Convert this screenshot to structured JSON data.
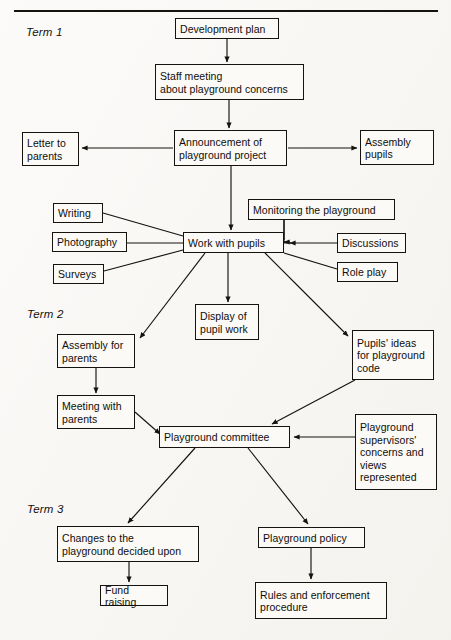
{
  "page": {
    "header_partial_text": "",
    "background_color": "#f5f3ef",
    "ink_color": "#16120e"
  },
  "terms": [
    {
      "id": "term-1",
      "label": "Term 1",
      "x": 26,
      "y": 26
    },
    {
      "id": "term-2",
      "label": "Term 2",
      "x": 27,
      "y": 308
    },
    {
      "id": "term-3",
      "label": "Term 3",
      "x": 27,
      "y": 503
    }
  ],
  "chart_data": {
    "type": "diagram",
    "nodes": [
      {
        "id": "development-plan",
        "label": "Development plan",
        "lines": [
          "Development plan"
        ],
        "x": 175,
        "y": 18,
        "w": 104,
        "h": 21,
        "term": "Term 1"
      },
      {
        "id": "staff-meeting",
        "label": "Staff meeting about playground concerns",
        "lines": [
          "Staff meeting",
          "about playground concerns"
        ],
        "x": 155,
        "y": 64,
        "w": 149,
        "h": 36,
        "term": "Term 1"
      },
      {
        "id": "letter-to-parents",
        "label": "Letter to parents",
        "lines": [
          "Letter to",
          "parents"
        ],
        "x": 22,
        "y": 132,
        "w": 57,
        "h": 34,
        "term": "Term 1"
      },
      {
        "id": "announcement",
        "label": "Announcement of playground project",
        "lines": [
          "Announcement of",
          "playground project"
        ],
        "x": 174,
        "y": 130,
        "w": 113,
        "h": 36,
        "term": "Term 1"
      },
      {
        "id": "assembly-pupils",
        "label": "Assembly pupils",
        "lines": [
          "Assembly",
          "pupils"
        ],
        "x": 360,
        "y": 130,
        "w": 74,
        "h": 35,
        "term": "Term 1"
      },
      {
        "id": "writing",
        "label": "Writing",
        "lines": [
          "Writing"
        ],
        "x": 53,
        "y": 203,
        "w": 50,
        "h": 20,
        "term": "Term 1"
      },
      {
        "id": "photography",
        "label": "Photography",
        "lines": [
          "Photography"
        ],
        "x": 52,
        "y": 232,
        "w": 75,
        "h": 20,
        "term": "Term 1"
      },
      {
        "id": "surveys",
        "label": "Surveys",
        "lines": [
          "Surveys"
        ],
        "x": 53,
        "y": 264,
        "w": 51,
        "h": 20,
        "term": "Term 1"
      },
      {
        "id": "monitoring-playground",
        "label": "Monitoring the playground",
        "lines": [
          "Monitoring the playground"
        ],
        "x": 248,
        "y": 199,
        "w": 147,
        "h": 21,
        "term": "Term 1"
      },
      {
        "id": "work-with-pupils",
        "label": "Work with pupils",
        "lines": [
          "Work with pupils"
        ],
        "x": 183,
        "y": 232,
        "w": 101,
        "h": 21,
        "term": "Term 1"
      },
      {
        "id": "discussions",
        "label": "Discussions",
        "lines": [
          "Discussions"
        ],
        "x": 337,
        "y": 233,
        "w": 69,
        "h": 20,
        "term": "Term 1"
      },
      {
        "id": "role-play",
        "label": "Role play",
        "lines": [
          "Role play"
        ],
        "x": 337,
        "y": 262,
        "w": 61,
        "h": 20,
        "term": "Term 1"
      },
      {
        "id": "display-pupil-work",
        "label": "Display of pupil work",
        "lines": [
          "Display of",
          "pupil work"
        ],
        "x": 195,
        "y": 304,
        "w": 64,
        "h": 36,
        "term": "Term 2"
      },
      {
        "id": "assembly-for-parents",
        "label": "Assembly for parents",
        "lines": [
          "Assembly for",
          "parents"
        ],
        "x": 57,
        "y": 334,
        "w": 78,
        "h": 34,
        "term": "Term 2"
      },
      {
        "id": "pupils-ideas",
        "label": "Pupils' ideas for playground code",
        "lines": [
          "Pupils' ideas",
          "for playground",
          "code"
        ],
        "x": 352,
        "y": 330,
        "w": 82,
        "h": 50,
        "term": "Term 2"
      },
      {
        "id": "meeting-with-parents",
        "label": "Meeting with parents",
        "lines": [
          "Meeting with",
          "parents"
        ],
        "x": 57,
        "y": 395,
        "w": 78,
        "h": 34,
        "term": "Term 2"
      },
      {
        "id": "playground-committee",
        "label": "Playground committee",
        "lines": [
          "Playground committee"
        ],
        "x": 159,
        "y": 426,
        "w": 131,
        "h": 22,
        "term": "Term 2"
      },
      {
        "id": "supervisors-concerns",
        "label": "Playground supervisors' concerns and views represented",
        "lines": [
          "Playground",
          "supervisors'",
          "concerns and",
          "views",
          "represented"
        ],
        "x": 355,
        "y": 414,
        "w": 82,
        "h": 76,
        "term": "Term 2"
      },
      {
        "id": "changes-to-playground",
        "label": "Changes to the playground decided upon",
        "lines": [
          "Changes to the",
          "playground decided upon"
        ],
        "x": 57,
        "y": 526,
        "w": 142,
        "h": 36,
        "term": "Term 3"
      },
      {
        "id": "playground-policy",
        "label": "Playground  policy",
        "lines": [
          "Playground  policy"
        ],
        "x": 258,
        "y": 527,
        "w": 107,
        "h": 21,
        "term": "Term 3"
      },
      {
        "id": "fund-raising",
        "label": "Fund raising",
        "lines": [
          "Fund raising"
        ],
        "x": 100,
        "y": 585,
        "w": 68,
        "h": 21,
        "term": "Term 3"
      },
      {
        "id": "rules-enforcement",
        "label": "Rules and enforcement procedure",
        "lines": [
          "Rules and enforcement",
          "procedure"
        ],
        "x": 255,
        "y": 582,
        "w": 132,
        "h": 37,
        "term": "Term 3"
      }
    ],
    "edges": [
      {
        "from": "development-plan",
        "to": "staff-meeting",
        "arrow": true
      },
      {
        "from": "staff-meeting",
        "to": "announcement",
        "arrow": true
      },
      {
        "from": "announcement",
        "to": "letter-to-parents",
        "arrow": true
      },
      {
        "from": "announcement",
        "to": "assembly-pupils",
        "arrow": true
      },
      {
        "from": "announcement",
        "to": "work-with-pupils",
        "arrow": true
      },
      {
        "from": "writing",
        "to": "work-with-pupils",
        "arrow": false
      },
      {
        "from": "photography",
        "to": "work-with-pupils",
        "arrow": false
      },
      {
        "from": "surveys",
        "to": "work-with-pupils",
        "arrow": false
      },
      {
        "from": "monitoring-playground",
        "to": "work-with-pupils",
        "arrow": true
      },
      {
        "from": "discussions",
        "to": "work-with-pupils",
        "arrow": true
      },
      {
        "from": "role-play",
        "to": "work-with-pupils",
        "arrow": false
      },
      {
        "from": "work-with-pupils",
        "to": "assembly-for-parents",
        "arrow": true
      },
      {
        "from": "work-with-pupils",
        "to": "display-pupil-work",
        "arrow": true
      },
      {
        "from": "work-with-pupils",
        "to": "pupils-ideas",
        "arrow": true
      },
      {
        "from": "assembly-for-parents",
        "to": "meeting-with-parents",
        "arrow": true
      },
      {
        "from": "meeting-with-parents",
        "to": "playground-committee",
        "arrow": true
      },
      {
        "from": "pupils-ideas",
        "to": "playground-committee",
        "arrow": true
      },
      {
        "from": "supervisors-concerns",
        "to": "playground-committee",
        "arrow": true
      },
      {
        "from": "playground-committee",
        "to": "changes-to-playground",
        "arrow": true
      },
      {
        "from": "playground-committee",
        "to": "playground-policy",
        "arrow": true
      },
      {
        "from": "changes-to-playground",
        "to": "fund-raising",
        "arrow": true
      },
      {
        "from": "playground-policy",
        "to": "rules-enforcement",
        "arrow": true
      }
    ]
  }
}
